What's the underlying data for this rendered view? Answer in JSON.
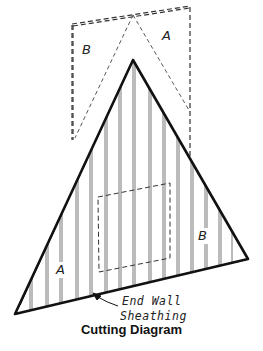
{
  "diagram": {
    "caption": "Cutting Diagram",
    "annotation_line1": "End Wall",
    "annotation_line2": "Sheathing",
    "piece_labels": {
      "top_left": "B",
      "top_right": "A",
      "bottom_left": "A",
      "bottom_right": "B"
    },
    "colors": {
      "line": "#111111",
      "background": "#ffffff"
    }
  }
}
